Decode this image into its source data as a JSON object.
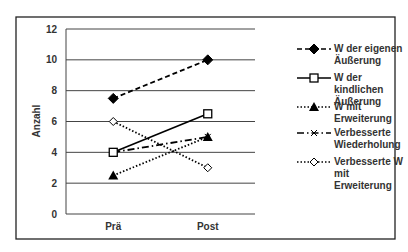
{
  "chart_data": {
    "type": "line",
    "title": "",
    "xlabel": "",
    "ylabel": "Anzahl",
    "categories": [
      "Prä",
      "Post"
    ],
    "ylim": [
      0,
      12
    ],
    "yticks": [
      0,
      2,
      4,
      6,
      8,
      10,
      12
    ],
    "grid": true,
    "legend_position": "right",
    "series": [
      {
        "name": "W der eigenen Äußerung",
        "label_lines": [
          "W der eigenen",
          "Äußerung"
        ],
        "values": [
          7.5,
          10
        ],
        "marker": "diamond-filled",
        "line": "dashed"
      },
      {
        "name": "W der kindlichen Äußerung",
        "label_lines": [
          "W der kindlichen",
          "Äußerung"
        ],
        "values": [
          4,
          6.5
        ],
        "marker": "square-open",
        "line": "solid"
      },
      {
        "name": "W mit Erweiterung",
        "label_lines": [
          "W mit Erweiterung"
        ],
        "values": [
          2.5,
          5
        ],
        "marker": "triangle-filled",
        "line": "dotted"
      },
      {
        "name": "Verbesserte Wiederholung",
        "label_lines": [
          "Verbesserte",
          "Wiederholung"
        ],
        "values": [
          4,
          5
        ],
        "marker": "x",
        "line": "dashdot"
      },
      {
        "name": "Verbesserte W mit Erweiterung",
        "label_lines": [
          "Verbesserte W mit",
          "Erweiterung"
        ],
        "values": [
          6,
          3
        ],
        "marker": "diamond-open",
        "line": "dotted"
      }
    ]
  }
}
